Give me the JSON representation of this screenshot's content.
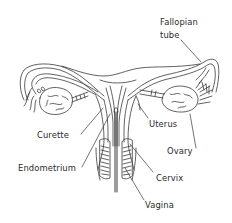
{
  "diagram": {
    "colors": {
      "background": "#ffffff",
      "line": "#3a3a3a",
      "text": "#2a2a2a"
    },
    "labels": {
      "fallopian_line1": "Fallopian",
      "fallopian_line2": "tube",
      "uterus": "Uterus",
      "ovary": "Ovary",
      "curette": "Curette",
      "endometrium": "Endometrium",
      "cervix": "Cervix",
      "vagina": "Vagina"
    },
    "structures": [
      "fallopian-tube-left",
      "fallopian-tube-right",
      "ovary-left",
      "ovary-right",
      "uterus",
      "endometrium",
      "cervix",
      "vagina",
      "curette"
    ]
  }
}
